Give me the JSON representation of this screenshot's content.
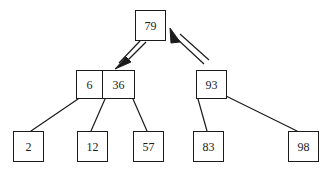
{
  "diagram": {
    "type": "b-tree-node-split-diagram",
    "background_color": "#ffffff",
    "line_color": "#1b1b1b",
    "nodes": [
      {
        "id": "root",
        "name": "root-node",
        "keys": [
          "79"
        ],
        "x": 135,
        "y": 10,
        "width": 31,
        "height": 31
      },
      {
        "id": "internal-left",
        "name": "internal-node-left",
        "keys": [
          "6",
          "36"
        ],
        "x": 76,
        "y": 70,
        "width": 59,
        "height": 29
      },
      {
        "id": "internal-right",
        "name": "internal-node-right",
        "keys": [
          "93"
        ],
        "x": 196,
        "y": 70,
        "width": 31,
        "height": 29
      },
      {
        "id": "leaf-1",
        "name": "leaf-node-2",
        "keys": [
          "2"
        ],
        "x": 13,
        "y": 131,
        "width": 31,
        "height": 31
      },
      {
        "id": "leaf-2",
        "name": "leaf-node-12",
        "keys": [
          "12"
        ],
        "x": 77,
        "y": 131,
        "width": 31,
        "height": 31
      },
      {
        "id": "leaf-3",
        "name": "leaf-node-57",
        "keys": [
          "57"
        ],
        "x": 133,
        "y": 131,
        "width": 31,
        "height": 31
      },
      {
        "id": "leaf-4",
        "name": "leaf-node-83",
        "keys": [
          "83"
        ],
        "x": 193,
        "y": 131,
        "width": 31,
        "height": 31
      },
      {
        "id": "leaf-5",
        "name": "leaf-node-98",
        "keys": [
          "98"
        ],
        "x": 288,
        "y": 131,
        "width": 31,
        "height": 31
      }
    ],
    "edges": [
      {
        "name": "edge-left-to-leaf-2",
        "from": "internal-left",
        "to": "leaf-1",
        "x1": 78,
        "y1": 99,
        "x2": 31,
        "y2": 131
      },
      {
        "name": "edge-left-to-leaf-12",
        "from": "internal-left",
        "to": "leaf-2",
        "x1": 105,
        "y1": 99,
        "x2": 91,
        "y2": 131
      },
      {
        "name": "edge-left-to-leaf-57",
        "from": "internal-left",
        "to": "leaf-3",
        "x1": 133,
        "y1": 99,
        "x2": 147,
        "y2": 131
      },
      {
        "name": "edge-right-to-leaf-83",
        "from": "internal-right",
        "to": "leaf-4",
        "x1": 198,
        "y1": 99,
        "x2": 207,
        "y2": 131
      },
      {
        "name": "edge-right-to-leaf-98",
        "from": "internal-right",
        "to": "leaf-5",
        "x1": 226,
        "y1": 96,
        "x2": 297,
        "y2": 131
      }
    ],
    "arrows": [
      {
        "name": "arrow-root-to-internal-left",
        "direction": "down-left",
        "from": "root",
        "to": "internal-left",
        "tail_x": 142,
        "tail_y": 41,
        "head_x": 124,
        "head_y": 67
      },
      {
        "name": "arrow-internal-right-to-root",
        "direction": "up-left",
        "from": "internal-right",
        "to": "root",
        "tail_x": 202,
        "tail_y": 67,
        "head_x": 171,
        "head_y": 31
      }
    ]
  }
}
